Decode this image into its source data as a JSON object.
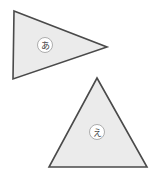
{
  "canvas": {
    "width": 157,
    "height": 182,
    "background_color": "#ffffff"
  },
  "style": {
    "shape_fill": "#ebebeb",
    "shape_stroke": "#4a4a4a",
    "shape_stroke_width": 1.6,
    "label_circle_fill": "#ffffff",
    "label_circle_stroke": "#9a9a9a",
    "label_text_color": "#3a3a3a"
  },
  "shapes": [
    {
      "id": "triangle-a",
      "kind": "triangle",
      "orientation": "pointing-right",
      "points": "14,11 107,47 13,79",
      "vertices": [
        [
          14,
          11
        ],
        [
          107,
          47
        ],
        [
          13,
          79
        ]
      ],
      "fill": "#ebebeb",
      "stroke": "#4a4a4a",
      "label": {
        "text": "あ",
        "romaji": "a",
        "cx": 45,
        "cy": 45,
        "r": 7.5
      }
    },
    {
      "id": "triangle-e",
      "kind": "triangle",
      "orientation": "pointing-up",
      "points": "97,78 147,167 49,167",
      "vertices": [
        [
          97,
          78
        ],
        [
          147,
          167
        ],
        [
          49,
          167
        ]
      ],
      "fill": "#ebebeb",
      "stroke": "#4a4a4a",
      "label": {
        "text": "え",
        "romaji": "e",
        "cx": 97,
        "cy": 132,
        "r": 7.5
      }
    }
  ]
}
